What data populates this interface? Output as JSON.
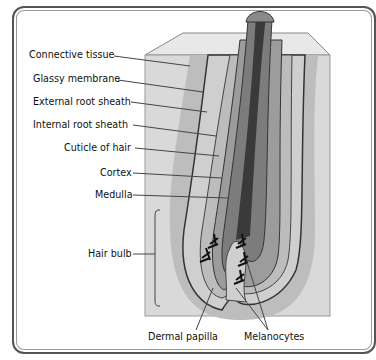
{
  "diagram": {
    "labels_left": [
      {
        "id": "connective-tissue",
        "text": "Connective tissue"
      },
      {
        "id": "glassy-membrane",
        "text": "Glassy membrane"
      },
      {
        "id": "external-root-sheath",
        "text": "External root sheath"
      },
      {
        "id": "internal-root-sheath",
        "text": "Internal root sheath"
      },
      {
        "id": "cuticle-of-hair",
        "text": "Cuticle of hair"
      },
      {
        "id": "cortex",
        "text": "Cortex"
      },
      {
        "id": "medulla",
        "text": "Medulla"
      },
      {
        "id": "hair-bulb",
        "text": "Hair bulb"
      }
    ],
    "labels_bottom": [
      {
        "id": "dermal-papilla",
        "text": "Dermal papilla"
      },
      {
        "id": "melanocytes",
        "text": "Melanocytes"
      }
    ],
    "colors": {
      "frame": "#555555",
      "tissue_block": "#d9d9d9",
      "tissue_shadow": "#b5b5b5",
      "outer_sheath": "#c8c8c8",
      "inner_sheath": "#9a9a9a",
      "cortex": "#7a7a7a",
      "medulla": "#3a3a3a",
      "leader_line": "#444444"
    }
  }
}
